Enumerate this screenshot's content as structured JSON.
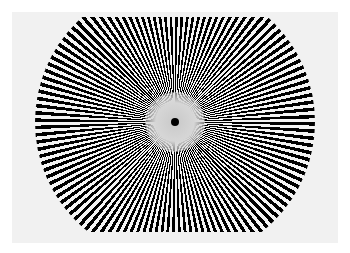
{
  "caption": {
    "text": ""
  },
  "figure": {
    "type": "siemens-star",
    "spoke_count": 120,
    "colors": {
      "spoke": "#000000",
      "gap": "#f4f4f4",
      "panel": "#f1f1f1",
      "page": "#ffffff",
      "center_dot": "#000000"
    }
  }
}
